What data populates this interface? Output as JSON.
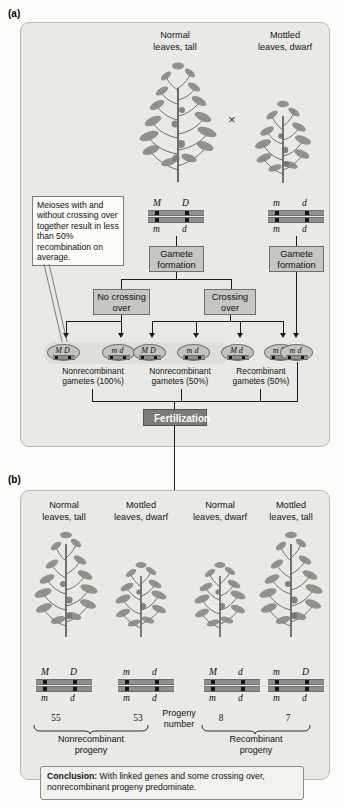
{
  "figure": {
    "panel_a_letter": "(a)",
    "panel_b_letter": "(b)"
  },
  "panel_a": {
    "parents": [
      {
        "line1": "Normal",
        "line2": "leaves, tall",
        "genotype_top": [
          "M",
          "D"
        ],
        "genotype_bottom": [
          "m",
          "d"
        ]
      },
      {
        "line1": "Mottled",
        "line2": "leaves, dwarf",
        "genotype_top": [
          "m",
          "d"
        ],
        "genotype_bottom": [
          "m",
          "d"
        ]
      }
    ],
    "cross_symbol": "×",
    "callout": "Meioses with and without crossing over together result in less than 50% recombination on average.",
    "gamete_formation_left": "Gamete formation",
    "gamete_formation_right": "Gamete formation",
    "no_crossing_over": "No crossing over",
    "crossing_over": "Crossing over",
    "gametes": [
      {
        "top": "M",
        "bottom": "D"
      },
      {
        "top": "m",
        "bottom": "d"
      },
      {
        "top": "M",
        "bottom": "D"
      },
      {
        "top": "m",
        "bottom": "d"
      },
      {
        "top": "M",
        "bottom": "d"
      },
      {
        "top": "m",
        "bottom": "D"
      },
      {
        "top": "m",
        "bottom": "d"
      }
    ],
    "gamete_captions": [
      {
        "line1": "Nonrecombinant",
        "line2": "gametes (100%)"
      },
      {
        "line1": "Nonrecombinant",
        "line2": "gametes (50%)"
      },
      {
        "line1": "Recombinant",
        "line2": "gametes (50%)"
      }
    ],
    "fertilization": "Fertilization"
  },
  "panel_b": {
    "progeny": [
      {
        "line1": "Normal",
        "line2": "leaves, tall",
        "genotype_top": [
          "M",
          "D"
        ],
        "genotype_bottom": [
          "m",
          "d"
        ],
        "number": "55"
      },
      {
        "line1": "Mottled",
        "line2": "leaves, dwarf",
        "genotype_top": [
          "m",
          "d"
        ],
        "genotype_bottom": [
          "m",
          "d"
        ],
        "number": "53"
      },
      {
        "line1": "Normal",
        "line2": "leaves, dwarf",
        "genotype_top": [
          "M",
          "d"
        ],
        "genotype_bottom": [
          "m",
          "d"
        ],
        "number": "8"
      },
      {
        "line1": "Mottled",
        "line2": "leaves, tall",
        "genotype_top": [
          "m",
          "D"
        ],
        "genotype_bottom": [
          "m",
          "d"
        ],
        "number": "7"
      }
    ],
    "progeny_number_label_line1": "Progeny",
    "progeny_number_label_line2": "number",
    "group_labels": [
      {
        "line1": "Nonrecombinant",
        "line2": "progeny"
      },
      {
        "line1": "Recombinant",
        "line2": "progeny"
      }
    ],
    "conclusion_prefix": "Conclusion:",
    "conclusion_text": " With linked genes and some crossing over, nonrecombinant progeny predominate."
  },
  "colors": {
    "panel_bg": "#e9e9e6",
    "process_box": "#c6c6c2",
    "fertilization_bg": "#7b7b78",
    "chromosome_bar": "#8f8f8f",
    "marker": "#151515"
  }
}
